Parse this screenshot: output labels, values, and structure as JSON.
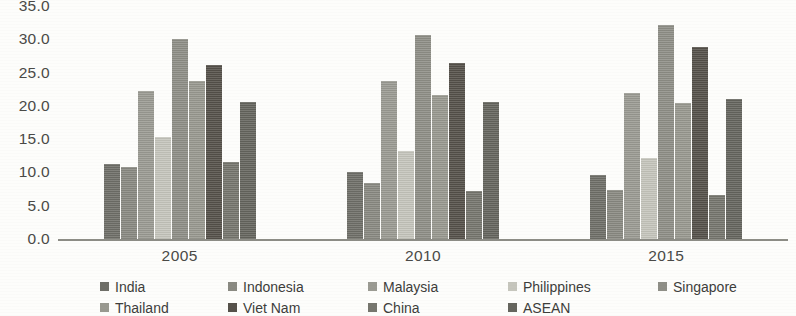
{
  "chart_data": {
    "type": "bar",
    "title": "",
    "subtitle": "",
    "xlabel": "",
    "ylabel": "",
    "categories": [
      "2005",
      "2010",
      "2015"
    ],
    "ylim": [
      0,
      35
    ],
    "ytick_step": 5,
    "ytick_labels": [
      "35.0",
      "30.0",
      "25.0",
      "20.0",
      "15.0",
      "10.0",
      "5.0",
      "0.0"
    ],
    "ytick_values": [
      35,
      30,
      25,
      20,
      15,
      10,
      5,
      0
    ],
    "grid": false,
    "legend_position": "bottom",
    "series": [
      {
        "name": "India",
        "color": "#6f6f68",
        "values": [
          11.3,
          10.1,
          9.6
        ]
      },
      {
        "name": "Indonesia",
        "color": "#8a8a82",
        "values": [
          10.8,
          8.4,
          7.4
        ]
      },
      {
        "name": "Malaysia",
        "color": "#9b9b93",
        "values": [
          22.3,
          23.7,
          22.0
        ]
      },
      {
        "name": "Philippines",
        "color": "#c6c6bd",
        "values": [
          15.3,
          13.2,
          12.1
        ]
      },
      {
        "name": "Singapore",
        "color": "#8f8f87",
        "values": [
          30.1,
          30.6,
          32.2
        ]
      },
      {
        "name": "Thailand",
        "color": "#999990",
        "values": [
          23.8,
          21.6,
          20.4
        ]
      },
      {
        "name": "Viet Nam",
        "color": "#55514a",
        "values": [
          26.2,
          26.4,
          28.9
        ]
      },
      {
        "name": "China",
        "color": "#76766e",
        "values": [
          11.5,
          7.2,
          6.6
        ]
      },
      {
        "name": "ASEAN",
        "color": "#65655e",
        "values": [
          20.6,
          20.6,
          21.0
        ]
      }
    ]
  },
  "legend": {
    "items": [
      {
        "label": "India"
      },
      {
        "label": "Indonesia"
      },
      {
        "label": "Malaysia"
      },
      {
        "label": "Philippines"
      },
      {
        "label": "Singapore"
      },
      {
        "label": "Thailand"
      },
      {
        "label": "Viet Nam"
      },
      {
        "label": "China"
      },
      {
        "label": "ASEAN"
      }
    ]
  },
  "colors": {
    "background": "#fdfdfb",
    "axis": "#8d8d86",
    "text": "#3a3a38"
  }
}
